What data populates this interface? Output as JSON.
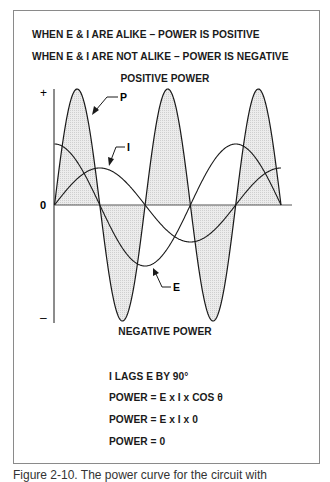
{
  "header": {
    "line1": "WHEN E & I ARE ALIKE – POWER IS POSITIVE",
    "line2": "WHEN E & I ARE NOT ALIKE – POWER IS NEGATIVE"
  },
  "diagram": {
    "top_label": "POSITIVE POWER",
    "bottom_label": "NEGATIVE POWER",
    "axis": {
      "plus": "+",
      "zero": "0",
      "minus": "–"
    },
    "curve_labels": {
      "power": "P",
      "current": "I",
      "voltage": "E"
    },
    "colors": {
      "line": "#1a1a1a",
      "fill": "#e6e6e6",
      "frame": "#8a8a8a"
    }
  },
  "equations": {
    "line1": "I LAGS E BY 90°",
    "line2": "POWER = E x I x COS θ",
    "line3": "POWER = E x I x 0",
    "line4": "POWER = 0"
  },
  "caption": {
    "text": "Figure 2-10. The power curve for the circuit with"
  }
}
